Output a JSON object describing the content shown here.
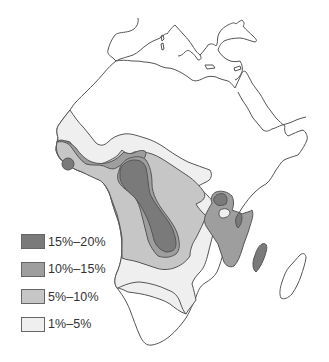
{
  "map": {
    "region": "Africa",
    "colors": {
      "outline": "#555555",
      "land": "#ffffff",
      "zone_15_20": "#7a7a7a",
      "zone_10_15": "#9e9e9e",
      "zone_5_10": "#c6c6c6",
      "zone_1_5": "#efefef"
    }
  },
  "legend": {
    "items": [
      {
        "label": "15%–20%",
        "color": "#7a7a7a"
      },
      {
        "label": "10%–15%",
        "color": "#9e9e9e"
      },
      {
        "label": "5%–10%",
        "color": "#c6c6c6"
      },
      {
        "label": "1%–5%",
        "color": "#efefef"
      }
    ]
  }
}
